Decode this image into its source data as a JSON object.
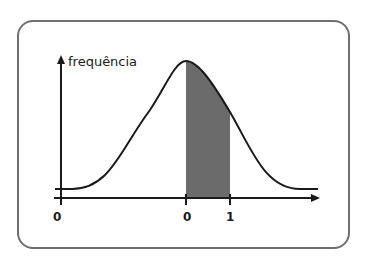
{
  "diagram": {
    "type": "normal-distribution-curve",
    "y_axis_label": "frequência",
    "x_ticks": [
      {
        "label": "0",
        "position": "origin"
      },
      {
        "label": "0",
        "position": "mean"
      },
      {
        "label": "1",
        "position": "one-std-dev"
      }
    ],
    "shaded_region": {
      "from": "0",
      "to": "1"
    },
    "colors": {
      "frame": "#6f6f6f",
      "curve": "#1a1a1a",
      "shade": "#6b6b6b"
    }
  }
}
